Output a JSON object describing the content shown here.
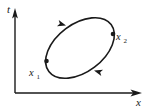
{
  "figure": {
    "type": "phase-space-orbit-diagram",
    "background_color": "#ffffff",
    "stroke_color": "#1a1a1a",
    "axes": {
      "vertical": {
        "label": "t",
        "label_name": "t-axis-label",
        "arrow": "up",
        "x": 15,
        "y_top": 9,
        "y_bottom": 93
      },
      "horizontal": {
        "label": "x",
        "label_name": "x-axis-label",
        "arrow": "right",
        "y": 93,
        "x_left": 15,
        "x_right": 141
      }
    },
    "curve": {
      "shape": "ellipse",
      "center_x": 80,
      "center_y": 48,
      "semi_major": 39,
      "semi_minor": 24,
      "rotation_deg": -37,
      "direction": "counterclockwise",
      "stroke_width": 1.5
    },
    "markers": [
      {
        "label": "x",
        "subscript": "1",
        "point_x": 46,
        "point_y": 61,
        "label_x": 30,
        "label_y": 75
      },
      {
        "label": "x",
        "subscript": "2",
        "point_x": 113,
        "point_y": 34,
        "label_x": 117,
        "label_y": 40
      }
    ],
    "arrowheads": [
      {
        "name": "arrowhead-upper-left",
        "x": 68,
        "y": 25,
        "angle_deg": 205
      },
      {
        "name": "arrowhead-lower-right",
        "x": 92,
        "y": 71,
        "angle_deg": 25
      }
    ]
  }
}
